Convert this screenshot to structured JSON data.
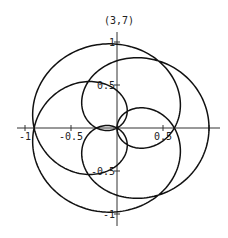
{
  "chart_data": {
    "type": "line",
    "subtype": "polar-rose",
    "title": "(3,7)",
    "equation": "r = cos(3θ/7)",
    "params": {
      "n": 3,
      "d": 7,
      "theta_min": 0,
      "theta_max_pi_multiple": 14,
      "samples": 1400
    },
    "xlabel": "",
    "ylabel": "",
    "xlim": [
      -1.0,
      1.1
    ],
    "ylim": [
      -1.1,
      1.0
    ],
    "x_ticks": [
      {
        "value": -1,
        "label": "-1"
      },
      {
        "value": -0.5,
        "label": "-0.5"
      },
      {
        "value": 0.5,
        "label": "0.5"
      },
      {
        "value": 1,
        "label": ""
      }
    ],
    "y_ticks": [
      {
        "value": 1,
        "label": "1"
      },
      {
        "value": 0.5,
        "label": "0.5"
      },
      {
        "value": -0.5,
        "label": "-0.5"
      },
      {
        "value": -1,
        "label": "-1"
      }
    ],
    "x_axis_crossings": [
      1.0,
      0.623,
      0.0,
      -0.223,
      -0.901
    ],
    "grid": false,
    "legend": null,
    "line_color": "#111111"
  },
  "layout": {
    "origin_px": [
      117,
      128
    ],
    "scale_x_px": 92,
    "scale_y_px": 86
  }
}
